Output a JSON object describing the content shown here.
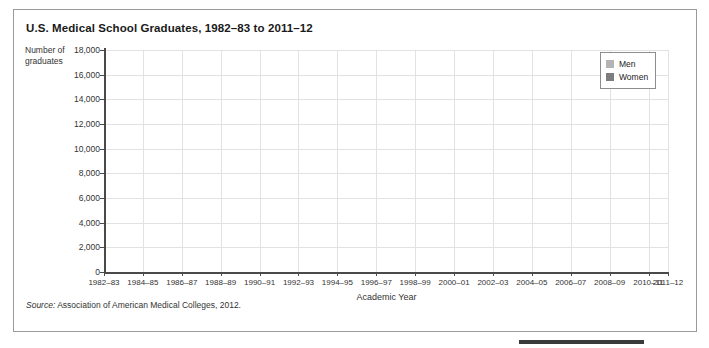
{
  "figure": {
    "title": "U.S. Medical School Graduates, 1982–83 to 2011–12",
    "source_prefix": "Source:",
    "source_text": " Association of American Medical Colleges, 2012."
  },
  "legend": {
    "position": "top-right",
    "entries": [
      {
        "label": "Men",
        "color": "#b4b4b4"
      },
      {
        "label": "Women",
        "color": "#7d7d7d"
      }
    ]
  },
  "colors": {
    "men": "#b4b4b4",
    "women": "#7d7d7d",
    "grid": "#e2e2e2",
    "axis": "#4a4a4a",
    "frame": "#9a9a9a",
    "text": "#333333"
  },
  "chart_data": {
    "type": "line",
    "title": "U.S. Medical School Graduates, 1982–83 to 2011–12",
    "xlabel": "Academic Year",
    "ylabel": "Number of graduates",
    "ylim": [
      0,
      18000
    ],
    "ytick_step": 2000,
    "yticks": [
      0,
      2000,
      4000,
      6000,
      8000,
      10000,
      12000,
      14000,
      16000,
      18000
    ],
    "ytick_labels": [
      "0",
      "2,000",
      "4,000",
      "6,000",
      "8,000",
      "10,000",
      "12,000",
      "14,000",
      "16,000",
      "18,000"
    ],
    "grid": true,
    "legend_position": "top-right",
    "categories": [
      "1982–83",
      "1983–84",
      "1984–85",
      "1985–86",
      "1986–87",
      "1987–88",
      "1988–89",
      "1989–90",
      "1990–91",
      "1991–92",
      "1992–93",
      "1993–94",
      "1994–95",
      "1995–96",
      "1996–97",
      "1997–98",
      "1998–99",
      "1999–00",
      "2000–01",
      "2001–02",
      "2002–03",
      "2003–04",
      "2004–05",
      "2005–06",
      "2006–07",
      "2007–08",
      "2008–09",
      "2009–10",
      "2010–11",
      "2011–12"
    ],
    "xtick_labels": [
      "1982–83",
      "1984–85",
      "1986–87",
      "1988–89",
      "1990–91",
      "1992–93",
      "1994–95",
      "1996–97",
      "1998–99",
      "2000–01",
      "2002–03",
      "2004–05",
      "2006–07",
      "2008–09",
      "2010–11",
      "2011–12"
    ],
    "xtick_indices": [
      0,
      2,
      4,
      6,
      8,
      10,
      12,
      14,
      16,
      18,
      20,
      22,
      24,
      26,
      28,
      29
    ],
    "series": [
      {
        "name": "Men",
        "color": "#b4b4b4",
        "values": [
          11800,
          11800,
          11750,
          11400,
          11250,
          11000,
          10800,
          10500,
          10350,
          10150,
          10200,
          10100,
          9800,
          9950,
          9700,
          9400,
          9250,
          9150,
          9100,
          9050,
          9000,
          8950,
          8800,
          8250,
          8150,
          8200,
          8350,
          8450,
          8850,
          9100
        ]
      },
      {
        "name": "Women",
        "color": "#7d7d7d",
        "values": [
          4100,
          4450,
          4750,
          4850,
          4950,
          5050,
          5200,
          5350,
          5500,
          5750,
          6000,
          6150,
          6350,
          6500,
          6650,
          6900,
          6800,
          6950,
          7150,
          7300,
          7450,
          7600,
          7900,
          8100,
          8050,
          8000,
          8050,
          8100,
          8200,
          8300
        ]
      }
    ]
  }
}
